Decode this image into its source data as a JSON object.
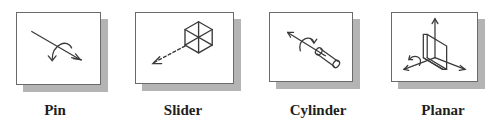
{
  "joints": [
    {
      "id": "pin",
      "label": "Pin",
      "icon": "pin-joint-icon"
    },
    {
      "id": "slider",
      "label": "Slider",
      "icon": "slider-joint-icon"
    },
    {
      "id": "cylinder",
      "label": "Cylinder",
      "icon": "cylinder-joint-icon"
    },
    {
      "id": "planar",
      "label": "Planar",
      "icon": "planar-joint-icon"
    }
  ],
  "colors": {
    "line": "#3a3a3a",
    "shadow": "#b4b4b4",
    "border": "#6a6a6a"
  }
}
